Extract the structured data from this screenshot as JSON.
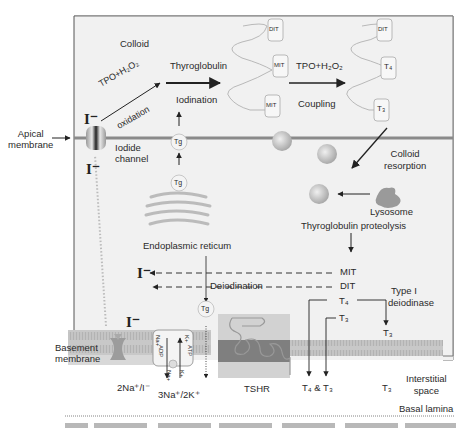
{
  "figure": {
    "regions": {
      "colloid": "Colloid",
      "apical_membrane": [
        "Apical",
        "membrane"
      ],
      "basement_membrane": [
        "Basement",
        "membrane"
      ],
      "interstitial_space": [
        "Interstitial",
        "space"
      ],
      "basal_lamina": "Basal lamina"
    },
    "structures": {
      "iodide_channel": [
        "Iodide",
        "channel"
      ],
      "endoplasmic_reticulum": "Endoplasmic reticum",
      "lysosome": "Lysosome",
      "tshr": "TSHR",
      "na_i_symporter": "2Na⁺/I⁻",
      "na_k_atpase": "3Na⁺/2K⁺",
      "pump_labels": {
        "na_in": "Na+",
        "k_in": "K+",
        "atp": "ATP",
        "adp": "ADP",
        "na_out": "Na+",
        "k_out": "K+"
      }
    },
    "processes": {
      "oxidation_top": "TPO+H₂O₂",
      "oxidation_bottom": "oxidation",
      "thyroglobulin": "Thyroglobulin",
      "iodination": "Iodination",
      "coupling_top": "TPO+H₂O₂",
      "coupling_bottom": "Coupling",
      "colloid_resorption": [
        "Colloid",
        "resorption"
      ],
      "proteolysis": "Thyroglobulin proteolysis",
      "deiodination": "Deiodination",
      "type1_deiodinase": [
        "Type I",
        "deiodinase"
      ]
    },
    "molecules": {
      "iodide": "I⁻",
      "tg": "Tg",
      "mit": "MIT",
      "dit": "DIT",
      "t4": "T₄",
      "t3": "T₃",
      "t4_t3": "T₄ & T₃",
      "chain_left": [
        "DIT",
        "MIT",
        "MIT"
      ],
      "chain_right": [
        "DIT",
        "T₄",
        "T₃"
      ]
    },
    "colors": {
      "cell_bg": "#f1f1f1",
      "membrane": "#8a8a8a",
      "membrane_band": "#bdbdbd",
      "tshr_box": "#d0d0d0",
      "tshr_band": "#7d7d7d",
      "line": "#222222"
    }
  }
}
